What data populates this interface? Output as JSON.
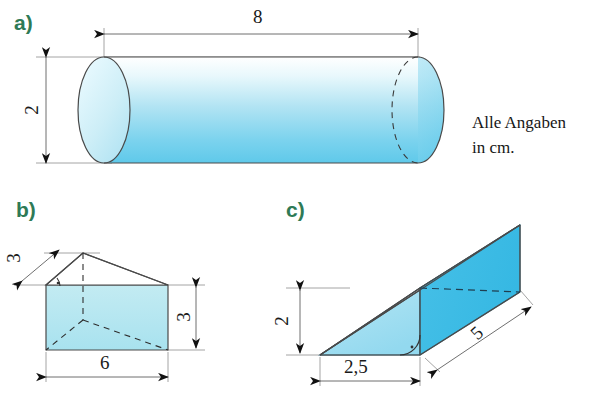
{
  "sheet": {
    "title": "Geometrische Koerper - Aufgabenskizze",
    "background_color": "#ffffff",
    "unit_note": {
      "line1": "Alle Angaben",
      "line2": "in cm."
    }
  },
  "colors": {
    "part_label": "#2e7a56",
    "outline": "#4a4a4a",
    "dimension_line": "#8a8a8a",
    "arrow": "#111111",
    "body_light": "#d9f2f8",
    "body_mid": "#8fd8ee",
    "body_dark": "#4cc2e8",
    "face_front_c": "#9fdcef",
    "face_side_c": "#3fbde6",
    "face_top_c": "#4ec4e8",
    "prism_b_fill": "#b6e6ef",
    "text": "#1a1a1a"
  },
  "figures": [
    {
      "id": "a",
      "label": "a)",
      "shape": "cylinder",
      "orientation": "horizontal",
      "dimensions": [
        {
          "name": "length",
          "value": "8",
          "unit": "cm",
          "placement": "top",
          "rotated": false
        },
        {
          "name": "diameter",
          "value": "2",
          "unit": "cm",
          "placement": "left",
          "rotated": true
        }
      ]
    },
    {
      "id": "b",
      "label": "b)",
      "shape": "triangular-prism",
      "dimensions": [
        {
          "name": "slant-edge",
          "value": "3",
          "unit": "cm",
          "placement": "upper-left",
          "rotated": true
        },
        {
          "name": "height",
          "value": "3",
          "unit": "cm",
          "placement": "right",
          "rotated": true
        },
        {
          "name": "base-width",
          "value": "6",
          "unit": "cm",
          "placement": "bottom",
          "rotated": false
        }
      ],
      "right_angle_marks": 1
    },
    {
      "id": "c",
      "label": "c)",
      "shape": "triangular-wedge",
      "dimensions": [
        {
          "name": "height",
          "value": "2",
          "unit": "cm",
          "placement": "left",
          "rotated": true
        },
        {
          "name": "depth",
          "value": "2,5",
          "unit": "cm",
          "placement": "bottom",
          "rotated": false
        },
        {
          "name": "length",
          "value": "5",
          "unit": "cm",
          "placement": "lower-right-diagonal",
          "rotated": true
        }
      ],
      "right_angle_marks": 1
    }
  ]
}
